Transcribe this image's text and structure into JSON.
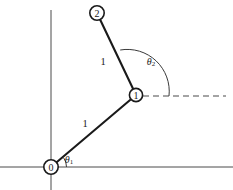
{
  "figure": {
    "kind": "two-link-planar-manipulator-diagram",
    "background_color": "#ffffff",
    "line_color": "#1a1a1a",
    "axis_color": "#4a4a4a",
    "width": 233,
    "height": 190
  },
  "axes": {
    "x_axis": {
      "name": "horizontal-axis",
      "x1": 0,
      "y1": 167,
      "x2": 233,
      "y2": 167
    },
    "y_axis": {
      "name": "vertical-axis",
      "x1": 51,
      "y1": 10,
      "x2": 51,
      "y2": 190
    }
  },
  "joints": [
    {
      "id": "0",
      "label": "0",
      "cx": 51,
      "cy": 167,
      "r": 7.2
    },
    {
      "id": "1",
      "label": "1",
      "cx": 136,
      "cy": 95,
      "r": 6.6
    },
    {
      "id": "2",
      "label": "2",
      "cx": 97,
      "cy": 13,
      "r": 7.2
    }
  ],
  "links": [
    {
      "name": "link-1",
      "from": "0",
      "to": "1",
      "length_label": "1",
      "label_x": 85,
      "label_y": 123
    },
    {
      "name": "link-2",
      "from": "1",
      "to": "2",
      "length_label": "1",
      "label_x": 103,
      "label_y": 61
    }
  ],
  "reference_ray": {
    "name": "horizontal-reference-dashed",
    "x1": 143,
    "y1": 96,
    "x2": 226,
    "y2": 96,
    "style": "dashed"
  },
  "angles": [
    {
      "name": "theta-1",
      "symbol": "θ",
      "subscript": "1",
      "label_x": 69,
      "label_y": 159,
      "vertex": "0"
    },
    {
      "name": "theta-2",
      "symbol": "θ",
      "subscript": "2",
      "label_x": 152,
      "label_y": 61,
      "vertex": "1"
    }
  ]
}
